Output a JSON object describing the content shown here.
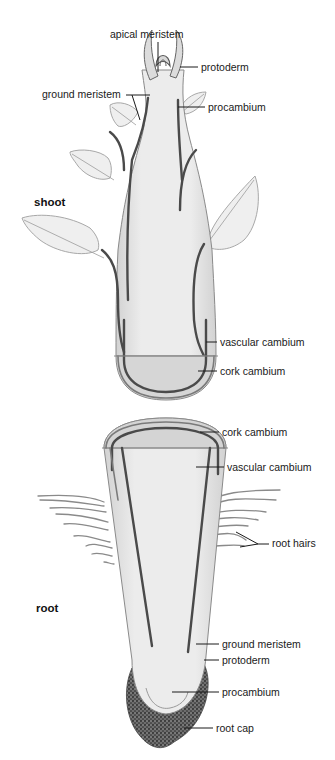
{
  "figure": {
    "sections": {
      "shoot": {
        "title": "shoot",
        "labels": {
          "apical_meristem": "apical meristem",
          "protoderm": "protoderm",
          "ground_meristem": "ground meristem",
          "procambium": "procambium",
          "vascular_cambium": "vascular cambium",
          "cork_cambium": "cork cambium"
        }
      },
      "root": {
        "title": "root",
        "labels": {
          "cork_cambium": "cork cambium",
          "vascular_cambium": "vascular cambium",
          "root_hairs": "root hairs",
          "ground_meristem": "ground meristem",
          "protoderm": "protoderm",
          "procambium": "procambium",
          "root_cap": "root cap"
        }
      }
    }
  }
}
